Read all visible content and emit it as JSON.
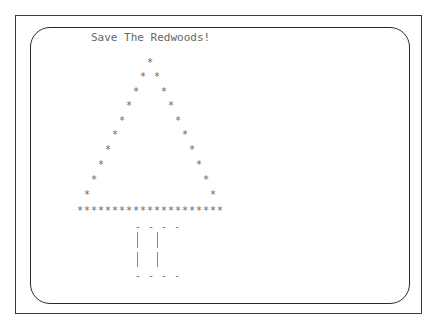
{
  "title": "Save The Redwoods!",
  "tree": {
    "glyph": "*",
    "char_width": 7,
    "apex_x": 150,
    "row_y": [
      63,
      77,
      92,
      106,
      121,
      135,
      150,
      165,
      180,
      195
    ],
    "base_y": 211,
    "base_count": 21,
    "base_start_x": 80
  },
  "trunk": {
    "top": "----",
    "bottom": "----",
    "side": "|",
    "left_x": 137,
    "right_x": 157,
    "top_y": 222,
    "bottom_y": 271,
    "bar_top_y": 232,
    "bar_bottom_y": 267,
    "dash_x": 135
  },
  "colors": {
    "frame": "#3a3a3a",
    "text": "#666666",
    "background": "#ffffff"
  }
}
